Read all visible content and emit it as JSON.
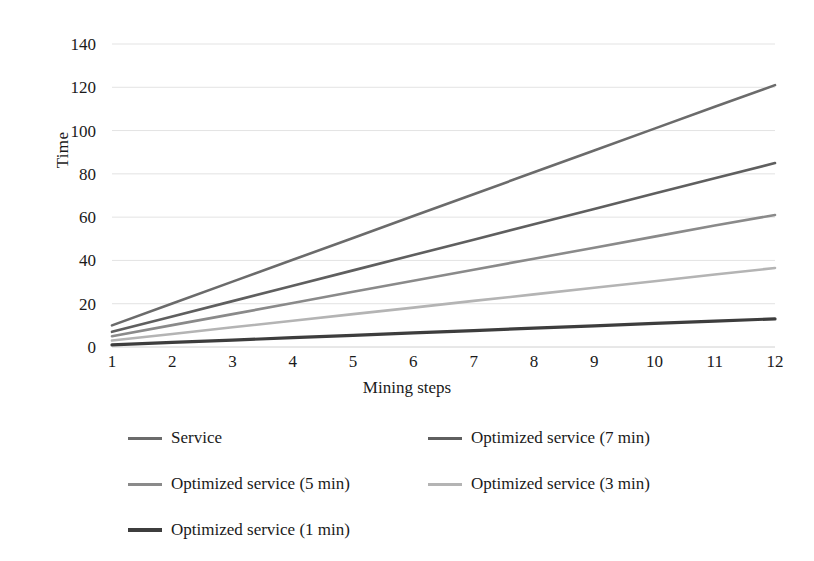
{
  "chart_data": {
    "type": "line",
    "title": "",
    "xlabel": "Mining steps",
    "ylabel": "Time",
    "x": [
      1,
      2,
      3,
      4,
      5,
      6,
      7,
      8,
      9,
      10,
      11,
      12
    ],
    "xtick_labels": [
      "1",
      "2",
      "3",
      "4",
      "5",
      "6",
      "7",
      "8",
      "9",
      "10",
      "11",
      "12"
    ],
    "ytick_labels": [
      "0",
      "20",
      "40",
      "60",
      "80",
      "100",
      "120",
      "140"
    ],
    "yticks": [
      0,
      20,
      40,
      60,
      80,
      100,
      120,
      140
    ],
    "ylim": [
      0,
      140
    ],
    "xlim": [
      1,
      12
    ],
    "grid": "horizontal",
    "legend_position": "bottom",
    "series": [
      {
        "name": "Service",
        "color": "#6b6b6b",
        "width": 2.6,
        "values": [
          10.0,
          20.1,
          30.2,
          40.3,
          50.4,
          60.5,
          70.6,
          80.7,
          90.8,
          100.9,
          111.0,
          121.0
        ]
      },
      {
        "name": "Optimized service (7 min)",
        "color": "#5f5f5f",
        "width": 2.6,
        "values": [
          7.0,
          14.1,
          21.2,
          28.3,
          35.4,
          42.5,
          49.6,
          56.7,
          63.8,
          70.9,
          78.0,
          85.0
        ]
      },
      {
        "name": "Optimized service (5 min)",
        "color": "#8a8a8a",
        "width": 2.6,
        "values": [
          5.0,
          10.1,
          15.2,
          20.3,
          25.5,
          30.6,
          35.7,
          40.8,
          45.9,
          51.0,
          56.1,
          61.0
        ]
      },
      {
        "name": "Optimized service (3 min)",
        "color": "#b4b4b4",
        "width": 2.6,
        "values": [
          3.0,
          6.0,
          9.1,
          12.1,
          15.2,
          18.2,
          21.3,
          24.3,
          27.4,
          30.4,
          33.5,
          36.5
        ]
      },
      {
        "name": "Optimized service (1 min)",
        "color": "#3d3d3d",
        "width": 3.2,
        "values": [
          1.0,
          2.1,
          3.2,
          4.3,
          5.4,
          6.5,
          7.6,
          8.7,
          9.8,
          10.9,
          12.0,
          13.0
        ]
      }
    ],
    "grid_color": "#e3e3e3",
    "axis_color": "#d0d0d0",
    "background": "#ffffff"
  }
}
